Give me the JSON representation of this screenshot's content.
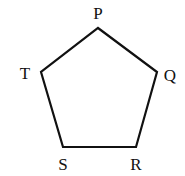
{
  "diagram": {
    "type": "pentagon",
    "stroke_color": "#111111",
    "fill_color": "#ffffff",
    "stroke_width": 2.2,
    "vertices": [
      {
        "name": "P",
        "x": 98,
        "y": 28,
        "label_x": 98,
        "label_y": 19
      },
      {
        "name": "Q",
        "x": 157,
        "y": 72,
        "label_x": 170,
        "label_y": 81
      },
      {
        "name": "R",
        "x": 136,
        "y": 147,
        "label_x": 136,
        "label_y": 170
      },
      {
        "name": "S",
        "x": 63,
        "y": 147,
        "label_x": 63,
        "label_y": 170
      },
      {
        "name": "T",
        "x": 41,
        "y": 72,
        "label_x": 25,
        "label_y": 79
      }
    ],
    "labels": {
      "p": "P",
      "q": "Q",
      "r": "R",
      "s": "S",
      "t": "T"
    }
  }
}
